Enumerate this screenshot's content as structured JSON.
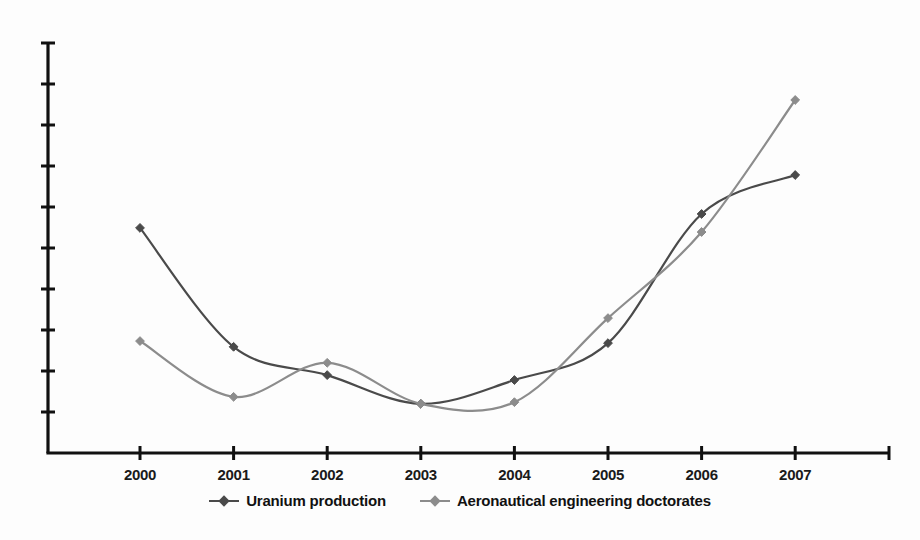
{
  "chart_data": {
    "type": "line",
    "title": "",
    "subtitle": "",
    "xlabel": "",
    "ylabel": "",
    "categories": [
      "2000",
      "2001",
      "2002",
      "2003",
      "2004",
      "2005",
      "2006",
      "2007"
    ],
    "x": [
      2000,
      2001,
      2002,
      2003,
      2004,
      2005,
      2006,
      2007
    ],
    "xlim": [
      1999.5,
      2007.5
    ],
    "ylim": [
      0,
      10
    ],
    "grid": false,
    "y_tick_labels": [
      "",
      "",
      "",
      "",
      "",
      "",
      "",
      "",
      "",
      ""
    ],
    "y_tick_values": [
      1,
      2,
      3,
      4,
      5,
      6,
      7,
      8,
      9,
      10
    ],
    "legend_position": "bottom",
    "smoothing": "spline",
    "series": [
      {
        "name": "Uranium production",
        "color": "#4a4a4a",
        "marker": "diamond",
        "values": [
          5.49,
          2.59,
          1.9,
          1.2,
          1.78,
          2.68,
          5.83,
          6.78
        ]
      },
      {
        "name": "Aeronautical engineering doctorates",
        "color": "#8c8c8c",
        "marker": "diamond",
        "values": [
          2.73,
          1.37,
          2.2,
          1.2,
          1.24,
          3.29,
          5.39,
          8.61
        ]
      }
    ]
  },
  "axes": {
    "x_axis_name": "year-axis",
    "y_axis_name": "value-axis"
  },
  "legend": {
    "items": [
      {
        "label": "Uranium production",
        "color": "#4a4a4a"
      },
      {
        "label": "Aeronautical engineering doctorates",
        "color": "#8c8c8c"
      }
    ]
  },
  "colors": {
    "background": "#fdfdfd",
    "axis": "#111111",
    "series_1": "#4a4a4a",
    "series_2": "#8c8c8c",
    "tick_label": "#1a1a1a"
  }
}
